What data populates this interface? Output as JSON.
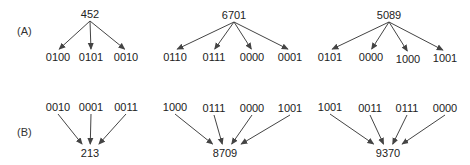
{
  "diagram": {
    "row_a": {
      "label": "(A)",
      "label_pos": [
        17,
        31
      ],
      "groups": [
        {
          "parent": {
            "text": "452",
            "x": 90,
            "y": 14
          },
          "children": [
            {
              "text": "0100",
              "x": 58,
              "y": 57
            },
            {
              "text": "0101",
              "x": 91,
              "y": 57
            },
            {
              "text": "0010",
              "x": 126,
              "y": 57
            }
          ]
        },
        {
          "parent": {
            "text": "6701",
            "x": 234,
            "y": 15
          },
          "children": [
            {
              "text": "0110",
              "x": 175,
              "y": 57
            },
            {
              "text": "0111",
              "x": 214,
              "y": 57
            },
            {
              "text": "0000",
              "x": 252,
              "y": 57
            },
            {
              "text": "0001",
              "x": 290,
              "y": 57
            }
          ]
        },
        {
          "parent": {
            "text": "5089",
            "x": 389,
            "y": 15
          },
          "children": [
            {
              "text": "0101",
              "x": 330,
              "y": 57
            },
            {
              "text": "0000",
              "x": 371,
              "y": 57
            },
            {
              "text": "1000",
              "x": 408,
              "y": 59
            },
            {
              "text": "1001",
              "x": 445,
              "y": 58
            }
          ]
        }
      ]
    },
    "row_b": {
      "label": "(B)",
      "label_pos": [
        17,
        132
      ],
      "groups": [
        {
          "result": {
            "text": "213",
            "x": 90,
            "y": 153
          },
          "inputs": [
            {
              "text": "0010",
              "x": 58,
              "y": 107
            },
            {
              "text": "0001",
              "x": 91,
              "y": 107
            },
            {
              "text": "0011",
              "x": 126,
              "y": 107
            }
          ]
        },
        {
          "result": {
            "text": "8709",
            "x": 225,
            "y": 153
          },
          "inputs": [
            {
              "text": "1000",
              "x": 175,
              "y": 107
            },
            {
              "text": "0111",
              "x": 214,
              "y": 108
            },
            {
              "text": "0000",
              "x": 252,
              "y": 108
            },
            {
              "text": "1001",
              "x": 290,
              "y": 108
            }
          ]
        },
        {
          "result": {
            "text": "9370",
            "x": 388,
            "y": 153
          },
          "inputs": [
            {
              "text": "1001",
              "x": 330,
              "y": 107
            },
            {
              "text": "0011",
              "x": 370,
              "y": 108
            },
            {
              "text": "0111",
              "x": 407,
              "y": 108
            },
            {
              "text": "0000",
              "x": 445,
              "y": 108
            }
          ]
        }
      ]
    },
    "colors": {
      "stroke": "#444444",
      "text": "#222222"
    }
  }
}
